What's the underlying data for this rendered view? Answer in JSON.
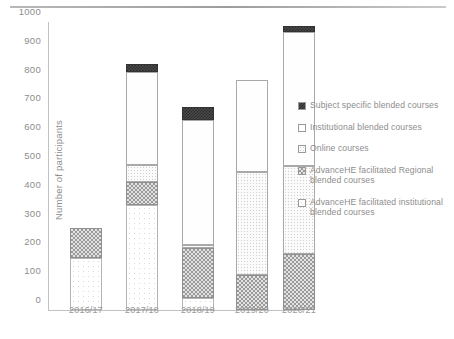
{
  "chart_data": {
    "type": "bar",
    "stacked": true,
    "title": "",
    "xlabel": "",
    "ylabel": "Number of participants",
    "ylim": [
      0,
      1000
    ],
    "ytick_step": 100,
    "yticks": [
      "0",
      "100",
      "200",
      "300",
      "400",
      "500",
      "600",
      "700",
      "800",
      "900",
      "1000"
    ],
    "grid": false,
    "legend_position": "right",
    "categories": [
      "2016/17",
      "2017/18",
      "2018/19",
      "2019/20",
      "2020/21"
    ],
    "series": [
      {
        "name": "AdvanceHE facilitated institutional blended courses",
        "pattern": "instfac",
        "values": [
          180,
          365,
          40,
          0,
          0
        ]
      },
      {
        "name": "AdvanceHE facilitated Regional blended courses",
        "pattern": "regional",
        "values": [
          105,
          80,
          175,
          120,
          195
        ]
      },
      {
        "name": "Online courses",
        "pattern": "online",
        "values": [
          0,
          60,
          10,
          360,
          305
        ]
      },
      {
        "name": "Institutional blended courses",
        "pattern": "institutional",
        "values": [
          0,
          320,
          435,
          320,
          465
        ]
      },
      {
        "name": "Subject specific blended courses",
        "pattern": "subject",
        "values": [
          0,
          30,
          45,
          0,
          20
        ]
      }
    ],
    "totals": [
      285,
      855,
      705,
      800,
      985
    ]
  },
  "legend": {
    "entries": [
      {
        "label": "Subject specific blended courses",
        "pattern": "subject"
      },
      {
        "label": "Institutional blended courses",
        "pattern": "institutional"
      },
      {
        "label": "Online courses",
        "pattern": "online"
      },
      {
        "label": "AdvanceHE facilitated Regional blended courses",
        "pattern": "regional"
      },
      {
        "label": "AdvanceHE facilitated institutional blended courses",
        "pattern": "instfac"
      }
    ]
  },
  "colors": {
    "axis": "#c2c2c2",
    "text": "#8d8d8d",
    "rule": "#a8a8a8"
  }
}
